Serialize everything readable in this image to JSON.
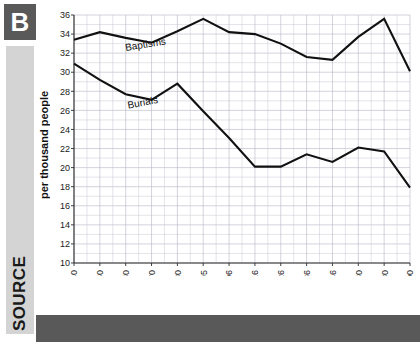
{
  "badge": {
    "letter": "B"
  },
  "source_rail": {
    "label": "SOURCE"
  },
  "chart_data": {
    "type": "line",
    "title": "",
    "xlabel": "",
    "ylabel": "per thousand people",
    "ylim": [
      10,
      36
    ],
    "ytick_step": 2,
    "yticks": [
      10,
      12,
      14,
      16,
      18,
      20,
      22,
      24,
      26,
      28,
      30,
      32,
      34,
      36
    ],
    "grid": true,
    "legend": "inline-annotations",
    "categories": [
      "1740",
      "1750",
      "1760",
      "1770",
      "1780",
      "1785–95",
      "1796–1806",
      "1806–16",
      "1816–26",
      "1826–36",
      "1836–46",
      "1851–60",
      "1871–80",
      "1891–1900"
    ],
    "series": [
      {
        "name": "Baptisms",
        "values": [
          33.4,
          34.2,
          33.6,
          33.1,
          34.3,
          35.6,
          34.2,
          34.0,
          33.0,
          31.6,
          31.3,
          33.7,
          35.6,
          30.1
        ]
      },
      {
        "name": "Burials",
        "values": [
          30.9,
          29.2,
          27.7,
          27.1,
          28.8,
          25.9,
          23.1,
          20.1,
          20.1,
          21.4,
          20.6,
          22.1,
          21.7,
          17.9
        ]
      }
    ],
    "annotations": [
      {
        "text": "Baptisms",
        "series": "Baptisms"
      },
      {
        "text": "Burials",
        "series": "Burials"
      }
    ]
  }
}
